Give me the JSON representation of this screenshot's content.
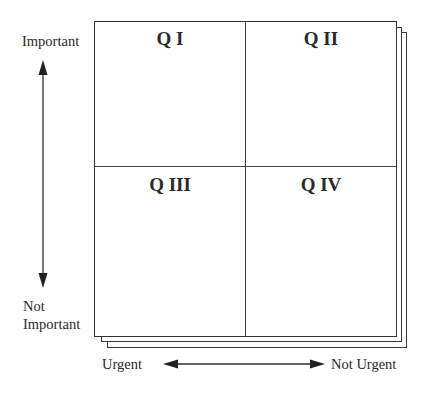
{
  "diagram": {
    "type": "eisenhower-matrix",
    "quadrants": [
      {
        "id": "q1",
        "label": "Q I",
        "position": "top-left"
      },
      {
        "id": "q2",
        "label": "Q II",
        "position": "top-right"
      },
      {
        "id": "q3",
        "label": "Q III",
        "position": "bottom-left"
      },
      {
        "id": "q4",
        "label": "Q IV",
        "position": "bottom-right"
      }
    ],
    "vertical_axis": {
      "top_label": "Important",
      "bottom_label_line1": "Not",
      "bottom_label_line2": "Important"
    },
    "horizontal_axis": {
      "left_label": "Urgent",
      "right_label": "Not Urgent"
    },
    "colors": {
      "line": "#333333",
      "text": "#2a2a2a",
      "background": "#ffffff"
    }
  }
}
